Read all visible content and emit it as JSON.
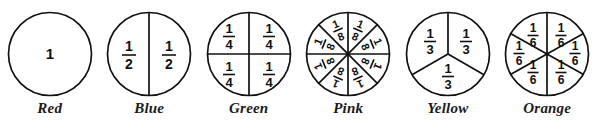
{
  "diagram": {
    "ink_color": "#111111",
    "background_color": "#ffffff",
    "circles": [
      {
        "label": "Red",
        "denominator": 1,
        "parts": 1,
        "part_label_numerator": "",
        "part_label_denominator": "",
        "whole_label": "1",
        "labels": [
          "1"
        ],
        "divider_style": "none"
      },
      {
        "label": "Blue",
        "denominator": 2,
        "parts": 2,
        "part_label_numerator": "1",
        "part_label_denominator": "2",
        "whole_label": "",
        "labels": [
          "1/2",
          "1/2"
        ],
        "divider_style": "vertical"
      },
      {
        "label": "Green",
        "denominator": 4,
        "parts": 4,
        "part_label_numerator": "1",
        "part_label_denominator": "4",
        "whole_label": "",
        "labels": [
          "1/4",
          "1/4",
          "1/4",
          "1/4"
        ],
        "divider_style": "cross"
      },
      {
        "label": "Pink",
        "denominator": 8,
        "parts": 8,
        "part_label_numerator": "1",
        "part_label_denominator": "8",
        "whole_label": "",
        "labels": [
          "1/8",
          "1/8",
          "1/8",
          "1/8",
          "1/8",
          "1/8",
          "1/8",
          "1/8"
        ],
        "divider_style": "eight-radii"
      },
      {
        "label": "Yellow",
        "denominator": 3,
        "parts": 3,
        "part_label_numerator": "1",
        "part_label_denominator": "3",
        "whole_label": "",
        "labels": [
          "1/3",
          "1/3",
          "1/3"
        ],
        "divider_style": "three-radii"
      },
      {
        "label": "Orange",
        "denominator": 6,
        "parts": 6,
        "part_label_numerator": "1",
        "part_label_denominator": "6",
        "whole_label": "",
        "labels": [
          "1/6",
          "1/6",
          "1/6",
          "1/6",
          "1/6",
          "1/6"
        ],
        "divider_style": "six-radii"
      }
    ]
  }
}
